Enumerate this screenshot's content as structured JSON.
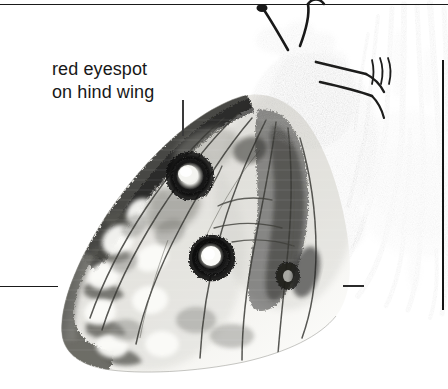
{
  "figure": {
    "kind": "annotated-photograph",
    "palette": {
      "background": "#ffffff",
      "rule": "#1a1a1a",
      "text": "#181818",
      "wing_pale": "#e9e9e6",
      "wing_mid": "#b9b9b5",
      "wing_dark": "#4a4a47",
      "body_dark": "#2d2d2b",
      "thistle": "#7a7a76",
      "eyespot_ring": "#141414",
      "eyespot_center": "#f2f2ef"
    }
  },
  "annotations": [
    {
      "id": "eyespot-callout",
      "line1": "red eyespot",
      "line2": "on hind wing",
      "text": "red eyespot\non hind wing",
      "leader": "vertical",
      "points_to": "upper-eyespot"
    }
  ],
  "rules": [
    {
      "id": "top-rule",
      "orientation": "horizontal",
      "x": 0,
      "y": 4,
      "length": 448
    },
    {
      "id": "left-rule",
      "orientation": "horizontal",
      "x": 0,
      "y": 286,
      "length": 58
    },
    {
      "id": "right-dash",
      "orientation": "horizontal",
      "x": 343,
      "y": 285,
      "length": 21
    },
    {
      "id": "right-vrule",
      "orientation": "vertical",
      "x": 442,
      "y": 60,
      "length": 250
    }
  ],
  "features": [
    {
      "id": "upper-eyespot",
      "label": "red eyespot on hind wing",
      "cx": 190,
      "cy": 176,
      "r": 20
    },
    {
      "id": "middle-eyespot",
      "label": "red eyespot on hind wing",
      "cx": 212,
      "cy": 258,
      "r": 19
    },
    {
      "id": "small-eyespot",
      "label": "small dark eyespot",
      "cx": 288,
      "cy": 276,
      "r": 11
    },
    {
      "id": "butterfly-body",
      "label": "butterfly thorax and head",
      "cx": 300,
      "cy": 60,
      "r": 45
    },
    {
      "id": "antennae",
      "label": "clubbed antennae",
      "cx": 290,
      "cy": 18,
      "r": 30
    },
    {
      "id": "thistle",
      "label": "thistle flower head",
      "cx": 410,
      "cy": 120,
      "r": 70
    }
  ]
}
